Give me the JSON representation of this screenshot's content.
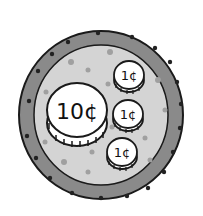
{
  "illustration": {
    "subject": "plate with coins",
    "colors": {
      "background": "#ffffff",
      "rim": "#8a8a8a",
      "plate_inner": "#d4d4d4",
      "dots": "#a0a0a0",
      "rim_dots": "#222222",
      "coin_face": "#ffffff",
      "outline": "#1a1a1a"
    },
    "coins": [
      {
        "label": "10¢",
        "value_cents": 10,
        "size": "large"
      },
      {
        "label": "1¢",
        "value_cents": 1,
        "size": "small"
      },
      {
        "label": "1¢",
        "value_cents": 1,
        "size": "small"
      },
      {
        "label": "1¢",
        "value_cents": 1,
        "size": "small"
      }
    ]
  }
}
